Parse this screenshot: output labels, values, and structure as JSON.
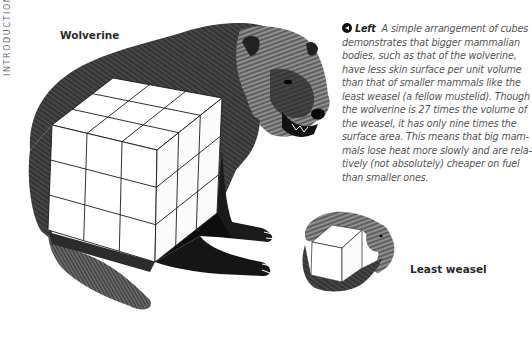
{
  "running_head": "Introduction",
  "labels": {
    "wolverine": "Wolverine",
    "least_weasel": "Least weasel"
  },
  "caption": {
    "icon": "left-arrow-circle-icon",
    "lead": "Left",
    "lines": [
      "A simple arrangement of cubes",
      "demonstrates that bigger mammalian",
      "bodies, such as that of the wolverine,",
      "have less skin surface per unit volume",
      "than that of smaller mammals like the",
      "least weasel (a fellow mustelid). Though",
      "the wolverine is 27 times the volume of",
      "the weasel, it has only nine times the",
      "surface area. This means that big mam-",
      "mals lose heat more slowly and are rela-",
      "tively (not absolutely) cheaper on fuel",
      "than smaller ones."
    ]
  },
  "illustration": {
    "large_cube_grid": "3x3x3",
    "small_cube_grid": "1x1x1",
    "ink_color": "#111111",
    "fur_mid": "#3a3a3a",
    "paper": "#ffffff"
  }
}
